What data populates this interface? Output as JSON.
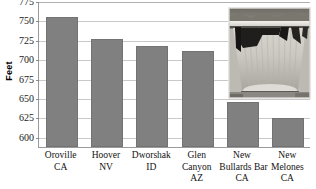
{
  "chart_data": {
    "type": "bar",
    "title": "",
    "xlabel": "",
    "ylabel": "Feet",
    "ylim": [
      587,
      775
    ],
    "grid": true,
    "legend": false,
    "yticks": [
      775,
      750,
      725,
      700,
      675,
      650,
      625,
      600
    ],
    "categories": [
      "Oroville CA",
      "Hoover NV",
      "Dworshak ID",
      "Glen Canyon AZ",
      "New Bullards Bar CA",
      "New Melones CA"
    ],
    "category_lines": [
      [
        "Oroville",
        "CA"
      ],
      [
        "Hoover",
        "NV"
      ],
      [
        "Dworshak",
        "ID"
      ],
      [
        "Glen",
        "Canyon",
        "AZ"
      ],
      [
        "New",
        "Bullards Bar",
        "CA"
      ],
      [
        "New",
        "Melones",
        "CA"
      ]
    ],
    "values": [
      754,
      726,
      717,
      710,
      645,
      625
    ],
    "bar_color": "#808080",
    "gridline_color": "#c9c9c9",
    "axis_color": "#9a9a9a"
  },
  "inset": {
    "name": "dam-photograph",
    "description": "Grayscale photograph of a concrete arch dam"
  }
}
